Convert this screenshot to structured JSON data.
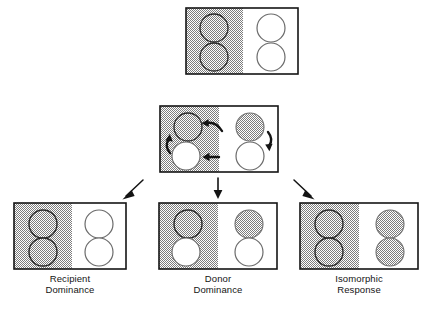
{
  "figure": {
    "title": "",
    "layout": "tree",
    "background_color": "#ffffff",
    "line_color": "#141414",
    "hatch_color": "#9a9a9a",
    "white_fill": "#ffffff"
  },
  "nodes": [
    {
      "id": "parent",
      "caption": "",
      "box": {
        "x": 186,
        "y": 8,
        "w": 112,
        "h": 66
      },
      "left_panel_fill": "hatched",
      "right_panel_fill": "white",
      "circles": [
        {
          "position": "left-top",
          "fill": "hatched"
        },
        {
          "position": "left-bottom",
          "fill": "hatched"
        },
        {
          "position": "right-top",
          "fill": "white"
        },
        {
          "position": "right-bottom",
          "fill": "white"
        }
      ],
      "arrows": []
    },
    {
      "id": "interaction",
      "caption": "",
      "box": {
        "x": 160,
        "y": 106,
        "w": 118,
        "h": 66
      },
      "left_panel_fill": "hatched",
      "right_panel_fill": "white",
      "circles": [
        {
          "position": "left-top",
          "fill": "hatched"
        },
        {
          "position": "left-bottom",
          "fill": "white"
        },
        {
          "position": "right-top",
          "fill": "hatched"
        },
        {
          "position": "right-bottom",
          "fill": "white"
        }
      ],
      "arrows": [
        {
          "name": "arrow-top-inward",
          "shape": "curved",
          "direction": "left"
        },
        {
          "name": "arrow-bottom-inward",
          "shape": "straight",
          "direction": "left"
        },
        {
          "name": "arrow-left-recirculate",
          "shape": "curved",
          "direction": "up"
        },
        {
          "name": "arrow-right-recirculate",
          "shape": "curved",
          "direction": "down"
        }
      ]
    },
    {
      "id": "recipient-dominance",
      "caption": "Recipient\nDominance",
      "box": {
        "x": 14,
        "y": 203,
        "w": 112,
        "h": 66
      },
      "left_panel_fill": "hatched",
      "right_panel_fill": "white",
      "circles": [
        {
          "position": "left-top",
          "fill": "hatched"
        },
        {
          "position": "left-bottom",
          "fill": "hatched"
        },
        {
          "position": "right-top",
          "fill": "white"
        },
        {
          "position": "right-bottom",
          "fill": "white"
        }
      ],
      "arrows": []
    },
    {
      "id": "donor-dominance",
      "caption": "Donor\nDominance",
      "box": {
        "x": 159,
        "y": 203,
        "w": 118,
        "h": 66
      },
      "left_panel_fill": "hatched",
      "right_panel_fill": "white",
      "circles": [
        {
          "position": "left-top",
          "fill": "hatched"
        },
        {
          "position": "left-bottom",
          "fill": "white"
        },
        {
          "position": "right-top",
          "fill": "hatched"
        },
        {
          "position": "right-bottom",
          "fill": "white"
        }
      ],
      "arrows": []
    },
    {
      "id": "isomorphic-response",
      "caption": "Isomorphic\nResponse",
      "box": {
        "x": 300,
        "y": 203,
        "w": 118,
        "h": 66
      },
      "left_panel_fill": "hatched",
      "right_panel_fill": "white",
      "circles": [
        {
          "position": "left-top",
          "fill": "hatched"
        },
        {
          "position": "left-bottom",
          "fill": "hatched"
        },
        {
          "position": "right-top",
          "fill": "hatched"
        },
        {
          "position": "right-bottom",
          "fill": "hatched"
        }
      ],
      "arrows": []
    }
  ],
  "connectors": [
    {
      "name": "connector-parent-to-interaction",
      "from": "parent",
      "to": "interaction",
      "style": "implicit"
    },
    {
      "name": "connector-to-recipient-dominance",
      "from": "interaction",
      "to": "recipient-dominance",
      "style": "diagonal-down-left"
    },
    {
      "name": "connector-to-donor-dominance",
      "from": "interaction",
      "to": "donor-dominance",
      "style": "vertical-down"
    },
    {
      "name": "connector-to-isomorphic-response",
      "from": "interaction",
      "to": "isomorphic-response",
      "style": "diagonal-down-right"
    }
  ],
  "captions": {
    "recipient": "Recipient\nDominance",
    "donor": "Donor\nDominance",
    "isomorphic": "Isomorphic\nResponse"
  }
}
